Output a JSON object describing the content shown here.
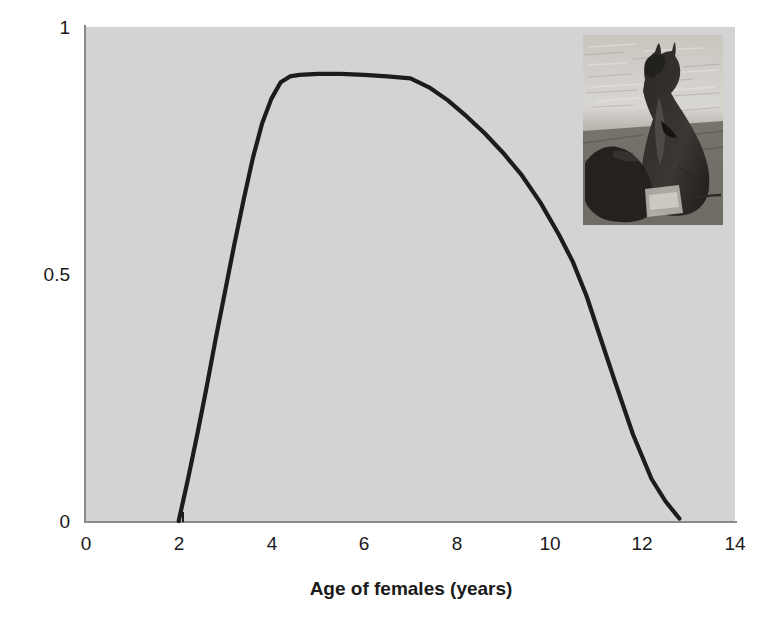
{
  "figure": {
    "background_color": "#ffffff",
    "plot_background_color": "#d3d3d3",
    "curve_color": "#1c1c1c",
    "axis_color": "#8a8a8a",
    "text_color": "#1a1a1a"
  },
  "axes": {
    "x_title": "Age of females (years)",
    "y_title": "Fecundity",
    "x_ticks": [
      "0",
      "2",
      "4",
      "6",
      "8",
      "10",
      "12",
      "14"
    ],
    "y_ticks": [
      "0",
      "0.5",
      "1"
    ]
  },
  "inset": {
    "name": "kangaroo-photo",
    "description": "Black and white photograph of a kangaroo with joey"
  },
  "chart_data": {
    "type": "line",
    "title": "",
    "xlabel": "Age of females (years)",
    "ylabel": "Fecundity",
    "xlim": [
      0,
      14
    ],
    "ylim": [
      0,
      1
    ],
    "xticks": [
      0,
      2,
      4,
      6,
      8,
      10,
      12,
      14
    ],
    "yticks": [
      0,
      0.5,
      1
    ],
    "grid": false,
    "legend": null,
    "series": [
      {
        "name": "Fecundity",
        "color": "#1c1c1c",
        "x": [
          2.0,
          2.2,
          2.4,
          2.6,
          2.8,
          3.0,
          3.2,
          3.4,
          3.6,
          3.8,
          4.0,
          4.2,
          4.4,
          4.6,
          5.0,
          5.5,
          6.0,
          6.5,
          7.0,
          7.4,
          7.8,
          8.2,
          8.6,
          9.0,
          9.4,
          9.8,
          10.2,
          10.5,
          10.8,
          11.1,
          11.4,
          11.8,
          12.2,
          12.5,
          12.8
        ],
        "y": [
          0.0,
          0.085,
          0.175,
          0.27,
          0.37,
          0.465,
          0.56,
          0.65,
          0.735,
          0.805,
          0.855,
          0.888,
          0.9,
          0.903,
          0.905,
          0.905,
          0.903,
          0.9,
          0.896,
          0.878,
          0.852,
          0.82,
          0.785,
          0.745,
          0.7,
          0.645,
          0.58,
          0.525,
          0.455,
          0.37,
          0.285,
          0.175,
          0.085,
          0.04,
          0.005
        ]
      }
    ],
    "annotations": [
      {
        "type": "image",
        "name": "kangaroo-photo",
        "description": "Inset black and white photograph of a kangaroo with joey",
        "x_range": [
          10.7,
          13.8
        ],
        "y_range": [
          0.6,
          0.98
        ]
      }
    ]
  }
}
